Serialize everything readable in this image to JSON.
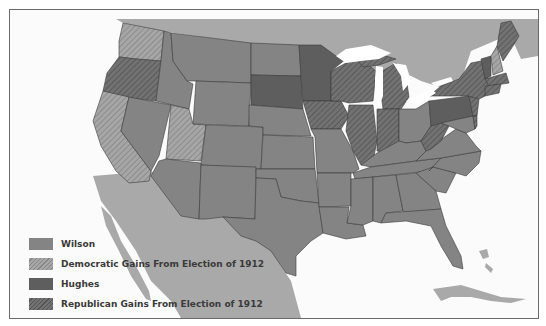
{
  "map": {
    "subject": "Presidential Election of 1916",
    "colors": {
      "background": "#fbfbfb",
      "foreign_land": "#a9a9a9",
      "water": "#ffffff",
      "wilson": "#848484",
      "democratic_gains_base": "#a4a4a4",
      "democratic_gains_hatch": "#8a8a8a",
      "hughes": "#5e5e5e",
      "republican_gains_base": "#6e6e6e",
      "republican_gains_hatch": "#555555",
      "border": "#3a3a3a"
    },
    "legend": [
      {
        "key": "wilson",
        "label": "Wilson",
        "pattern": "solid-medium-gray"
      },
      {
        "key": "democratic_gains",
        "label": "Democratic Gains From Election of 1912",
        "pattern": "light-hatched"
      },
      {
        "key": "hughes",
        "label": "Hughes",
        "pattern": "solid-dark-gray"
      },
      {
        "key": "republican_gains",
        "label": "Republican Gains From Election of 1912",
        "pattern": "dark-hatched"
      }
    ],
    "states": {
      "wilson": [
        "Idaho",
        "Montana",
        "Wyoming",
        "Nevada",
        "Colorado",
        "Arizona",
        "New Mexico",
        "North Dakota",
        "Nebraska",
        "Kansas",
        "Oklahoma",
        "Texas",
        "Missouri",
        "Arkansas",
        "Louisiana",
        "Ohio",
        "Kentucky",
        "Tennessee",
        "Mississippi",
        "Alabama",
        "Georgia",
        "Florida",
        "South Carolina",
        "North Carolina",
        "Virginia",
        "Maryland",
        "New Hampshire"
      ],
      "democratic_gains": [
        "Washington",
        "California",
        "Utah"
      ],
      "hughes": [
        "South Dakota",
        "Minnesota",
        "Pennsylvania",
        "Vermont"
      ],
      "republican_gains": [
        "Oregon",
        "Iowa",
        "Wisconsin",
        "Michigan",
        "Illinois",
        "Indiana",
        "West Virginia",
        "New York",
        "New Jersey",
        "Delaware",
        "Connecticut",
        "Rhode Island",
        "Massachusetts",
        "Maine"
      ]
    }
  }
}
